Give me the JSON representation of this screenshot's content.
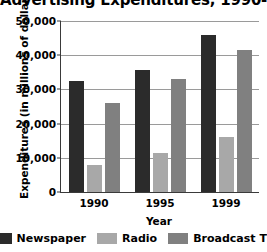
{
  "chart_data": {
    "type": "bar",
    "title": "Advertising Expenditures, 1990-1999",
    "xlabel": "Year",
    "ylabel": "Expenditures (in millions of dollars)",
    "categories": [
      "1990",
      "1995",
      "1999"
    ],
    "series": [
      {
        "name": "Newspaper",
        "color": "#2b2b2b",
        "values": [
          32500,
          35800,
          46000
        ]
      },
      {
        "name": "Radio",
        "color": "#a8a8a8",
        "values": [
          8000,
          11500,
          16000
        ]
      },
      {
        "name": "Broadcast TV",
        "color": "#808080",
        "values": [
          26000,
          33000,
          41500
        ]
      }
    ],
    "ylim": [
      0,
      50000
    ],
    "ytick_labels": [
      "0",
      "10,000",
      "20,000",
      "30,000",
      "40,000",
      "50,000"
    ],
    "ytick_values": [
      0,
      10000,
      20000,
      30000,
      40000,
      50000
    ],
    "grid": true,
    "legend_position": "bottom"
  }
}
